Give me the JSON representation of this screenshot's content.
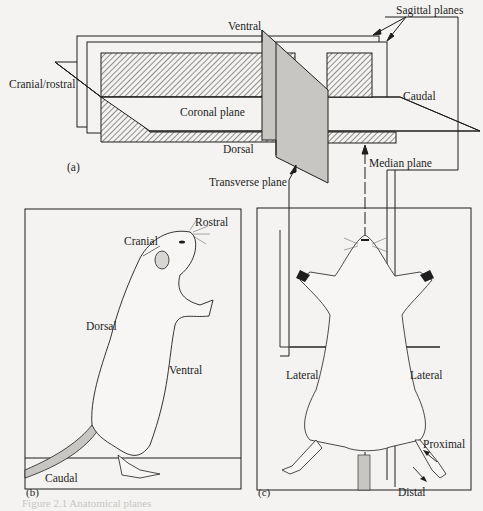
{
  "figure": {
    "panel_a": {
      "tag": "(a)",
      "labels": {
        "sagittal_planes": "Sagittal planes",
        "ventral": "Ventral",
        "cranial_rostral": "Cranial/rostral",
        "caudal": "Caudal",
        "coronal_plane": "Coronal plane",
        "dorsal": "Dorsal",
        "transverse_plane": "Transverse plane",
        "median_plane": "Median plane"
      }
    },
    "panel_b": {
      "tag": "(b)",
      "labels": {
        "rostral": "Rostral",
        "cranial": "Cranial",
        "dorsal": "Dorsal",
        "ventral": "Ventral",
        "caudal": "Caudal"
      }
    },
    "panel_c": {
      "tag": "(c)",
      "labels": {
        "lateral_left": "Lateral",
        "lateral_right": "Lateral",
        "proximal": "Proximal",
        "distal": "Distal"
      }
    },
    "caption": "Figure 2.1  Anatomical planes"
  },
  "colors": {
    "ink": "#1e1e1e",
    "paper": "#f4f3f1",
    "plane_fill": "#c8c6c3",
    "hatch": "#3a3a3a"
  }
}
